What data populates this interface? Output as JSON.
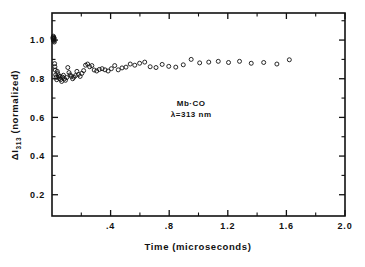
{
  "chart_data": {
    "type": "scatter",
    "title": "",
    "xlabel": "Time (microseconds)",
    "ylabel": "ΔI₃₁₃ (normalized)",
    "ylabel_main": "ΔI",
    "ylabel_sub": "313",
    "ylabel_rest": " (normalized)",
    "xlim": [
      0,
      2.0
    ],
    "ylim": [
      0.09,
      1.14
    ],
    "grid": false,
    "legend": null,
    "marker": "open-circle",
    "annotations": [
      {
        "text": "Mb·CO",
        "x": 0.95,
        "y": 0.66
      },
      {
        "text": "λ=313 nm",
        "x": 0.95,
        "y": 0.6
      }
    ],
    "xticks_major": [
      0.4,
      0.8,
      1.2,
      1.6,
      2.0
    ],
    "xticks_major_labels": [
      ".4",
      ".8",
      "1.2",
      "1.6",
      "2.0"
    ],
    "xticks_minor": [
      0.2,
      0.6,
      1.0,
      1.4,
      1.8
    ],
    "yticks_major": [
      0.2,
      0.4,
      0.6,
      0.8,
      1.0
    ],
    "yticks_major_labels": [
      "0.2",
      "0.4",
      "0.6",
      "0.8",
      "1.0"
    ],
    "yticks_minor": [
      0.3,
      0.5,
      0.7,
      0.9,
      1.1
    ],
    "x": [
      0.006,
      0.008,
      0.009,
      0.01,
      0.011,
      0.012,
      0.013,
      0.014,
      0.015,
      0.016,
      0.018,
      0.02,
      0.022,
      0.025,
      0.028,
      0.032,
      0.036,
      0.04,
      0.045,
      0.05,
      0.055,
      0.06,
      0.066,
      0.072,
      0.078,
      0.085,
      0.092,
      0.1,
      0.108,
      0.116,
      0.124,
      0.132,
      0.141,
      0.15,
      0.16,
      0.17,
      0.181,
      0.192,
      0.204,
      0.216,
      0.229,
      0.243,
      0.257,
      0.272,
      0.288,
      0.305,
      0.323,
      0.342,
      0.362,
      0.383,
      0.405,
      0.428,
      0.452,
      0.478,
      0.505,
      0.534,
      0.565,
      0.598,
      0.633,
      0.67,
      0.71,
      0.752,
      0.797,
      0.845,
      0.896,
      0.95,
      1.008,
      1.07,
      1.135,
      1.205,
      1.28,
      1.36,
      1.445,
      1.535,
      1.62
    ],
    "y": [
      1.012,
      1.005,
      1.02,
      0.998,
      1.008,
      1.015,
      0.995,
      1.002,
      1.01,
      0.99,
      0.878,
      0.862,
      0.845,
      0.82,
      0.808,
      0.795,
      0.838,
      0.826,
      0.815,
      0.802,
      0.812,
      0.796,
      0.786,
      0.808,
      0.818,
      0.8,
      0.792,
      0.806,
      0.858,
      0.832,
      0.82,
      0.812,
      0.8,
      0.808,
      0.816,
      0.838,
      0.822,
      0.812,
      0.828,
      0.842,
      0.87,
      0.876,
      0.862,
      0.868,
      0.845,
      0.84,
      0.848,
      0.852,
      0.846,
      0.84,
      0.852,
      0.868,
      0.846,
      0.856,
      0.86,
      0.876,
      0.87,
      0.88,
      0.886,
      0.862,
      0.858,
      0.874,
      0.864,
      0.86,
      0.872,
      0.9,
      0.882,
      0.886,
      0.89,
      0.884,
      0.89,
      0.88,
      0.884,
      0.876,
      0.898
    ]
  },
  "figure": {
    "frame": {
      "left": 52,
      "right": 345,
      "top": 13,
      "bottom": 216
    }
  }
}
